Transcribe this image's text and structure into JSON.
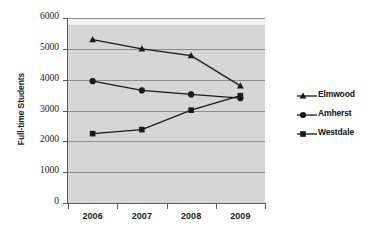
{
  "chart_data": {
    "type": "line",
    "title": "",
    "xlabel": "",
    "ylabel": "Full-time Students",
    "categories": [
      "2006",
      "2007",
      "2008",
      "2009"
    ],
    "ylim": [
      0,
      6000
    ],
    "yticks": [
      "0",
      "1000",
      "2000",
      "3000",
      "4000",
      "5000",
      "6000"
    ],
    "ytick_values": [
      0,
      1000,
      2000,
      3000,
      4000,
      5000,
      6000
    ],
    "grid": true,
    "legend_position": "right",
    "plot_background": "#d6d6d6",
    "line_color": "#1a1a1a",
    "series": [
      {
        "name": "Elmwood",
        "marker": "triangle",
        "values": [
          5300,
          5000,
          4780,
          3800
        ]
      },
      {
        "name": "Amherst",
        "marker": "circle",
        "values": [
          3950,
          3650,
          3520,
          3400
        ]
      },
      {
        "name": "Westdale",
        "marker": "square",
        "values": [
          2250,
          2380,
          3010,
          3480
        ]
      }
    ]
  }
}
